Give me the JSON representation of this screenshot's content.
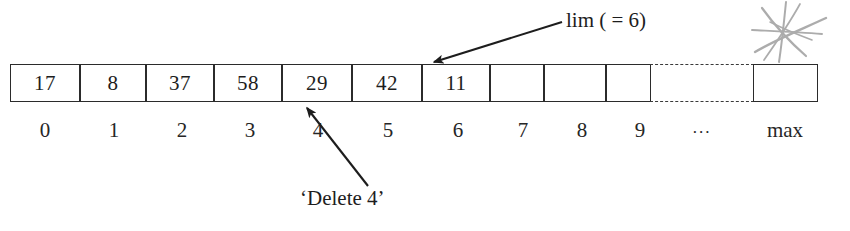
{
  "diagram": {
    "array": {
      "cells": [
        {
          "index": "0",
          "value": "17"
        },
        {
          "index": "1",
          "value": "8"
        },
        {
          "index": "2",
          "value": "37"
        },
        {
          "index": "3",
          "value": "58"
        },
        {
          "index": "4",
          "value": "29"
        },
        {
          "index": "5",
          "value": "42"
        },
        {
          "index": "6",
          "value": "11"
        },
        {
          "index": "7",
          "value": ""
        },
        {
          "index": "8",
          "value": ""
        },
        {
          "index": "9",
          "value": ""
        }
      ],
      "ellipsis_label": "...",
      "max_label": "max",
      "max_cell_value": ""
    },
    "annotations": {
      "lim": {
        "label": "lim ( = 6)",
        "points_to_index": "7"
      },
      "delete": {
        "label": "‘Delete 4’",
        "points_to_index": "4"
      },
      "scribble": "star-scribble-mark"
    },
    "colors": {
      "ink": "#1d1d1d",
      "border": "#2b2b2b",
      "dash": "#3a3a3a",
      "background": "#ffffff",
      "scribble": "#8d8d8d"
    }
  }
}
